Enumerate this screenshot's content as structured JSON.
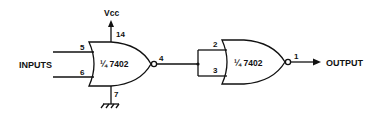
{
  "diagram": {
    "type": "logic-circuit",
    "supply_label": "Vcc",
    "inputs_label": "INPUTS",
    "output_label": "OUTPUT",
    "gates": [
      {
        "id": "gate1",
        "type": "NOR",
        "label": "¼ 7402",
        "pins": {
          "in_a": "5",
          "in_b": "6",
          "out": "4",
          "vcc": "14",
          "gnd": "7"
        }
      },
      {
        "id": "gate2",
        "type": "NOR",
        "label": "¼ 7402",
        "pins": {
          "in_a": "2",
          "in_b": "3",
          "out": "1"
        }
      }
    ],
    "connections": [
      "INPUTS -> gate1.pin5",
      "INPUTS -> gate1.pin6",
      "gate1.pin14 -> Vcc",
      "gate1.pin7 -> ground",
      "gate1.pin4 -> gate2.pin2",
      "gate1.pin4 -> gate2.pin3",
      "gate2.pin1 -> OUTPUT"
    ]
  }
}
